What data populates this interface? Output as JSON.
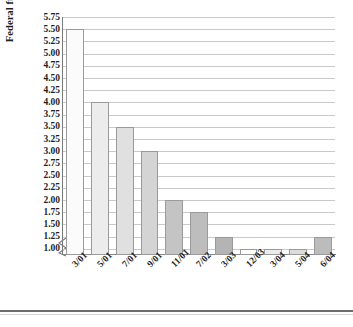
{
  "chart_data": {
    "type": "bar",
    "title": "",
    "xlabel": "",
    "ylabel": "Federal funds rate",
    "categories": [
      "3/01",
      "5/01",
      "7/01",
      "9/01",
      "11/01",
      "7/02",
      "3/03",
      "12/03",
      "3/04",
      "5/04",
      "6/04"
    ],
    "values": [
      5.5,
      4.0,
      3.5,
      3.0,
      2.0,
      1.75,
      1.25,
      1.0,
      1.0,
      1.0,
      1.25
    ],
    "ylim": [
      0.875,
      5.75
    ],
    "ytick_labels": [
      "5.75",
      "5.50",
      "5.25",
      "5.00",
      "4.75",
      "4.50",
      "4.25",
      "4.00",
      "3.75",
      "3.50",
      "3.25",
      "3.00",
      "2.75",
      "2.50",
      "2.25",
      "2.00",
      "1.75",
      "1.50",
      "1.25",
      "1.00"
    ],
    "ytick_values": [
      5.75,
      5.5,
      5.25,
      5.0,
      4.75,
      4.5,
      4.25,
      4.0,
      3.75,
      3.5,
      3.25,
      3.0,
      2.75,
      2.5,
      2.25,
      2.0,
      1.75,
      1.5,
      1.25,
      1.0
    ],
    "ytick_step": 0.25,
    "grid": true,
    "axis_break": true,
    "legend": null,
    "bar_colors": [
      "#fbfbfb",
      "#ececec",
      "#e0e0e0",
      "#d4d4d4",
      "#c4c4c4",
      "#bdbdbd",
      "#b4b4b4",
      "#fcfcfc",
      "#ebebeb",
      "#dcdcdc",
      "#bcbcbc"
    ],
    "bar_edge_color": "#9a9a9a",
    "grid_color": "#c9c9c9",
    "axis_color": "#7a7a7a",
    "text_color": "#1f1f1f"
  },
  "axis": {
    "y_title": "Federal funds rate"
  }
}
